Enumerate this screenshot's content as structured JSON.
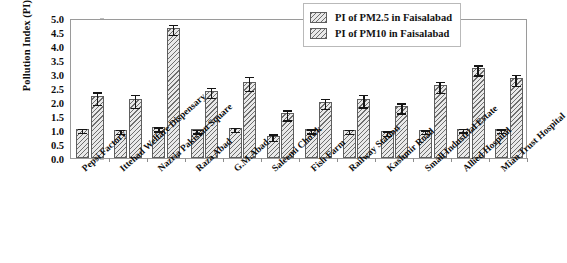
{
  "chart_data": {
    "type": "bar",
    "title": "",
    "xlabel": "",
    "ylabel": "Pollution Index (PI)",
    "ylim": [
      0,
      5
    ],
    "ytick_labels": [
      "0.0",
      "0.5",
      "1.0",
      "1.5",
      "2.0",
      "2.5",
      "3.0",
      "3.5",
      "4.0",
      "4.5",
      "5.0"
    ],
    "ytick_values": [
      0,
      0.5,
      1,
      1.5,
      2,
      2.5,
      3,
      3.5,
      4,
      4.5,
      5
    ],
    "grid": false,
    "legend_position": "top-right",
    "categories": [
      "Pepsi Factory",
      "Ittehad Welfare Dispensary",
      "Nazria Pakistan Square",
      "Raza Abad",
      "G.M.Abad",
      "Saleemi Chowk",
      "Fish Farm",
      "Railway Station",
      "Kashmir Road",
      "Small Industrial Estate",
      "Allied Hospital",
      "Mian Trust Hospital"
    ],
    "series": [
      {
        "name": "PI of PM2.5 in Faisalabad",
        "values": [
          1.05,
          1.0,
          1.1,
          1.02,
          1.07,
          0.8,
          1.03,
          1.0,
          0.95,
          1.0,
          1.05,
          1.03
        ],
        "errors": [
          0.07,
          0.07,
          0.07,
          0.06,
          0.07,
          0.12,
          0.07,
          0.07,
          0.08,
          0.06,
          0.06,
          0.06
        ]
      },
      {
        "name": "PI of PM10 in Faisalabad",
        "values": [
          2.2,
          2.1,
          4.65,
          2.4,
          2.73,
          1.6,
          2.0,
          2.1,
          1.85,
          2.6,
          3.2,
          2.85
        ],
        "errors": [
          0.22,
          0.23,
          0.18,
          0.18,
          0.25,
          0.18,
          0.18,
          0.22,
          0.18,
          0.2,
          0.18,
          0.2
        ]
      }
    ]
  },
  "legend": {
    "items": [
      {
        "label": "PI of PM2.5 in Faisalabad",
        "swatch": "hatched-swatch"
      },
      {
        "label": "PI of PM10 in Faisalabad",
        "swatch": "hatched-swatch"
      }
    ]
  }
}
